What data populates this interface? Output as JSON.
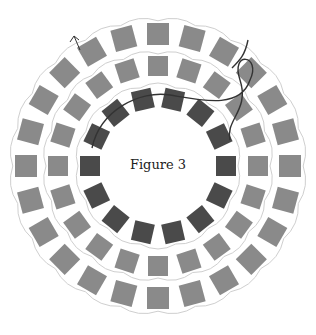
{
  "figure": {
    "caption": "Figure 3",
    "center": [
      158,
      166
    ],
    "colors": {
      "outer": "#8a8a8a",
      "middle": "#8a8a8a",
      "inner": "#4a4a4a",
      "light": "#c8c8c8",
      "thread": "#cfcfcf",
      "working_thread": "#333333"
    },
    "rings": [
      {
        "name": "outer-ring",
        "radius": 132,
        "count": 24,
        "size": 22,
        "color": "outer"
      },
      {
        "name": "middle-ring",
        "radius": 100,
        "count": 20,
        "size": 20,
        "color": "middle"
      },
      {
        "name": "inner-ring",
        "radius": 68,
        "count": 14,
        "size": 20,
        "color": "inner"
      }
    ]
  }
}
